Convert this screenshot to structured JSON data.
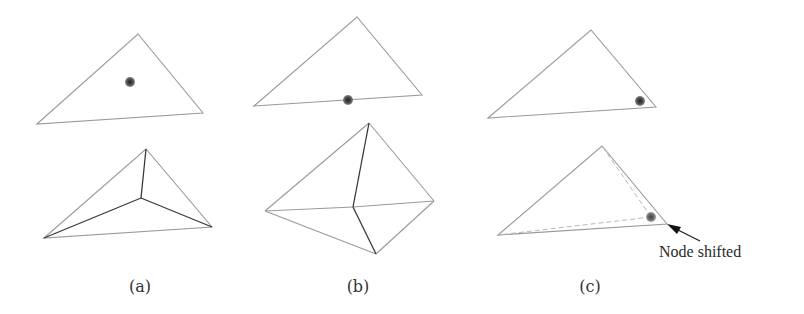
{
  "figure": {
    "panels": [
      {
        "id": "a",
        "label": "(a)",
        "top": {
          "vertices": [
            [
              37,
              124
            ],
            [
              138,
              34
            ],
            [
              203,
              113
            ]
          ],
          "node": [
            130,
            82
          ],
          "node_position": "interior"
        },
        "bottom": {
          "vertices": [
            [
              44,
              238
            ],
            [
              146,
              149
            ],
            [
              212,
              227
            ]
          ],
          "center": [
            141,
            198
          ],
          "split": "3 triangles from interior node"
        }
      },
      {
        "id": "b",
        "label": "(b)",
        "top": {
          "vertices": [
            [
              254,
              106
            ],
            [
              357,
              17
            ],
            [
              422,
              95
            ]
          ],
          "node": [
            348,
            100
          ],
          "node_position": "on edge"
        },
        "bottom": {
          "vertices": [
            [
              265,
              211
            ],
            [
              369,
              123
            ],
            [
              434,
              201
            ],
            [
              376,
              254
            ]
          ],
          "center": [
            353,
            207
          ],
          "split": "4 triangles from edge node"
        }
      },
      {
        "id": "c",
        "label": "(c)",
        "top": {
          "vertices": [
            [
              488,
              118
            ],
            [
              591,
              30
            ],
            [
              656,
              107
            ]
          ],
          "node": [
            640,
            101
          ],
          "node_position": "near vertex"
        },
        "bottom": {
          "vertices": [
            [
              498,
              235
            ],
            [
              602,
              146
            ],
            [
              667,
              224
            ]
          ],
          "shifted_node": [
            651,
            217
          ],
          "annotation": "Node shifted"
        }
      }
    ],
    "colors": {
      "edge": "#9a9a9a",
      "split_edge": "#3a3a3a",
      "node": "#444444",
      "background": "#ffffff"
    }
  }
}
